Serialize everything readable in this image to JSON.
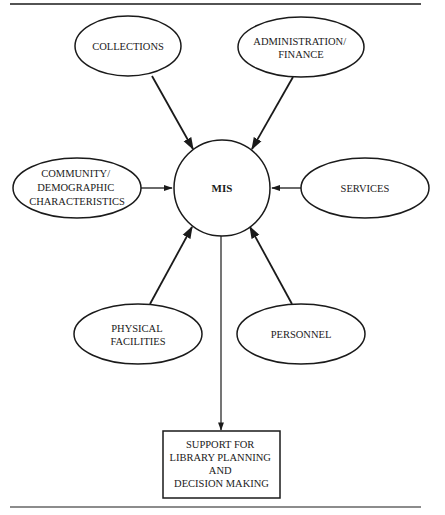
{
  "diagram": {
    "center": {
      "id": "mis",
      "label": "MIS",
      "shape": "circle"
    },
    "inputs": [
      {
        "id": "collections",
        "lines": [
          "COLLECTIONS"
        ]
      },
      {
        "id": "administration-finance",
        "lines": [
          "ADMINISTRATION/",
          "FINANCE"
        ]
      },
      {
        "id": "community-demographic",
        "lines": [
          "COMMUNITY/",
          "DEMOGRAPHIC",
          "CHARACTERISTICS"
        ]
      },
      {
        "id": "services",
        "lines": [
          "SERVICES"
        ]
      },
      {
        "id": "physical-facilities",
        "lines": [
          "PHYSICAL",
          "FACILITIES"
        ]
      },
      {
        "id": "personnel",
        "lines": [
          "PERSONNEL"
        ]
      }
    ],
    "output": {
      "id": "support-box",
      "lines": [
        "SUPPORT FOR",
        "LIBRARY PLANNING",
        "AND",
        "DECISION MAKING"
      ],
      "shape": "rectangle"
    },
    "edges": [
      {
        "from": "collections",
        "to": "mis"
      },
      {
        "from": "administration-finance",
        "to": "mis"
      },
      {
        "from": "community-demographic",
        "to": "mis"
      },
      {
        "from": "services",
        "to": "mis"
      },
      {
        "from": "physical-facilities",
        "to": "mis"
      },
      {
        "from": "personnel",
        "to": "mis"
      },
      {
        "from": "mis",
        "to": "support-box"
      }
    ],
    "colors": {
      "stroke": "#1a1a1a",
      "background": "#ffffff"
    }
  }
}
